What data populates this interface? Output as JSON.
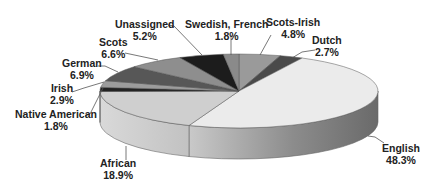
{
  "chart_data": {
    "type": "pie",
    "style": "3d",
    "title": "",
    "start_angle_deg": -90,
    "direction": "clockwise",
    "slices": [
      {
        "label": "Scots-Irish",
        "value": 4.8,
        "display": "4.8%",
        "color": "#9a9a9a"
      },
      {
        "label": "Dutch",
        "value": 2.7,
        "display": "2.7%",
        "color": "#4a4a4a"
      },
      {
        "label": "English",
        "value": 48.3,
        "display": "48.3%",
        "color": "#ebebeb"
      },
      {
        "label": "African",
        "value": 18.9,
        "display": "18.9%",
        "color": "#cfcfcf"
      },
      {
        "label": "Native American",
        "value": 1.8,
        "display": "1.8%",
        "color": "#222222"
      },
      {
        "label": "Irish",
        "value": 2.9,
        "display": "2.9%",
        "color": "#9c9c9c"
      },
      {
        "label": "German",
        "value": 6.9,
        "display": "6.9%",
        "color": "#575757"
      },
      {
        "label": "Scots",
        "value": 6.6,
        "display": "6.6%",
        "color": "#8e8e8e"
      },
      {
        "label": "Unassigned",
        "value": 5.2,
        "display": "5.2%",
        "color": "#1c1c1c"
      },
      {
        "label": "Swedish, French",
        "value": 1.8,
        "display": "1.8%",
        "color": "#8a8a8a"
      }
    ],
    "legend": "none",
    "labels_outside_with_leader_lines": true
  },
  "labels": [
    {
      "name": "Unassigned",
      "pct": "5.2%"
    },
    {
      "name": "Swedish, French",
      "pct": "1.8%"
    },
    {
      "name": "Scots-Irish",
      "pct": "4.8%"
    },
    {
      "name": "Dutch",
      "pct": "2.7%"
    },
    {
      "name": "Scots",
      "pct": "6.6%"
    },
    {
      "name": "German",
      "pct": "6.9%"
    },
    {
      "name": "Irish",
      "pct": "2.9%"
    },
    {
      "name": "Native American",
      "pct": "1.8%"
    },
    {
      "name": "African",
      "pct": "18.9%"
    },
    {
      "name": "English",
      "pct": "48.3%"
    }
  ]
}
